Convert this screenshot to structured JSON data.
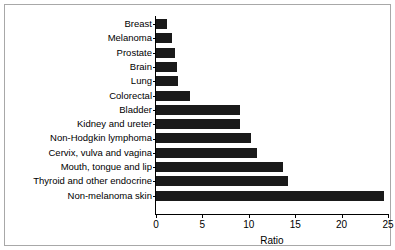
{
  "chart_data": {
    "type": "bar",
    "orientation": "horizontal",
    "title": "",
    "xlabel": "Ratio",
    "ylabel": "",
    "xlim": [
      0,
      25
    ],
    "xticks": [
      0,
      5,
      10,
      15,
      20,
      25
    ],
    "grid": false,
    "legend": null,
    "bar_color": "#1a1a1a",
    "categories": [
      "Breast",
      "Melanoma",
      "Prostate",
      "Brain",
      "Lung",
      "Colorectal",
      "Bladder",
      "Kidney and ureter",
      "Non-Hodgkin lymphoma",
      "Cervix, vulva and vagina",
      "Mouth, tongue and lip",
      "Thyroid and other endocrine",
      "Non-melanoma skin"
    ],
    "values": [
      1.2,
      1.7,
      2.0,
      2.3,
      2.4,
      3.7,
      9.0,
      9.0,
      10.2,
      10.9,
      13.7,
      14.2,
      24.6
    ]
  },
  "axis": {
    "x_title": "Ratio"
  }
}
